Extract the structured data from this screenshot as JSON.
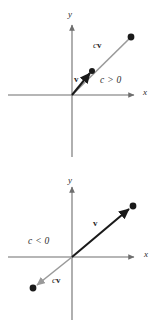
{
  "figure": {
    "width": 156,
    "height": 328,
    "background": "#ffffff",
    "colors": {
      "axis": "#6e6e6e",
      "vector_v": "#1a1a1a",
      "vector_cv": "#9a9a9a",
      "point": "#1a1a1a",
      "text": "#2b2b2b"
    }
  },
  "panels": [
    {
      "id": "panel-positive",
      "name": "positive-scalar-panel",
      "condition_label": "c > 0",
      "axis_x_label": "x",
      "axis_y_label": "y",
      "vector_label": "v",
      "scaled_label_prefix": "c",
      "scaled_label_vector": "v",
      "description": "Vector v points up and to the right; cv is a longer vector in the same direction.",
      "geometry": {
        "origin": [
          72,
          95
        ],
        "v_tip": [
          92,
          71
        ],
        "cv_tip": [
          131,
          37
        ],
        "x_axis": [
          8,
          95,
          140,
          95
        ],
        "y_axis": [
          72,
          22,
          72,
          157
        ]
      }
    },
    {
      "id": "panel-negative",
      "name": "negative-scalar-panel",
      "condition_label": "c < 0",
      "axis_x_label": "x",
      "axis_y_label": "y",
      "vector_label": "v",
      "scaled_label_prefix": "c",
      "scaled_label_vector": "v",
      "description": "Vector v points up and to the right; cv points down and to the left, opposite direction.",
      "geometry": {
        "origin": [
          72,
          257
        ],
        "v_tip": [
          133,
          206
        ],
        "cv_tip": [
          33,
          288
        ],
        "x_axis": [
          8,
          257,
          140,
          257
        ],
        "y_axis": [
          72,
          184,
          72,
          320
        ]
      }
    }
  ]
}
